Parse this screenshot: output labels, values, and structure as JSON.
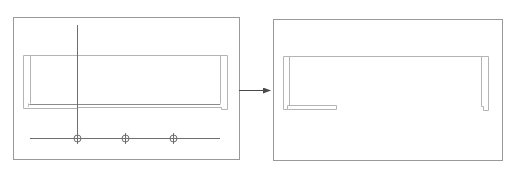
{
  "diagram": {
    "type": "before-after-transformation",
    "colors": {
      "frame": "#9a9a9a",
      "shape": "#b4b4b4",
      "axis": "#6e6e6e",
      "arrow": "#4a4a4a",
      "background": "#ffffff"
    },
    "panels": [
      {
        "id": "before",
        "description": "Rectangular profile with vertical axis and horizontal track carrying three circular markers",
        "markers": 3
      },
      {
        "id": "after",
        "description": "Rectangular profile with bottom rail shortened on the left side and removed on the right"
      }
    ],
    "connector": {
      "type": "arrow",
      "direction": "right"
    }
  }
}
